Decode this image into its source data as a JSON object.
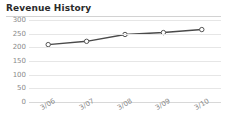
{
  "header": {
    "title": "Revenue History"
  },
  "chart_data": {
    "type": "line",
    "title": "Revenue History",
    "xlabel": "",
    "ylabel": "",
    "categories": [
      "3/06",
      "3/07",
      "3/08",
      "3/09",
      "3/10"
    ],
    "series": [
      {
        "name": "Revenue",
        "values": [
          210,
          222,
          247,
          254,
          265
        ]
      }
    ],
    "ylim": [
      0,
      300
    ],
    "yticks": [
      300,
      250,
      200,
      150,
      100,
      50,
      0
    ],
    "ytick_labels": [
      "300",
      "250",
      "200",
      "150",
      "100",
      "50",
      "0"
    ],
    "grid": true,
    "legend": "none",
    "marker": "open-circle",
    "colors": {
      "line": "#4a4a4a",
      "marker_fill": "#ffffff",
      "marker_stroke": "#555555",
      "grid": "#e6e6e6",
      "axis_text": "#8a8a8a",
      "title_text": "#2b2b2b",
      "rule": "#d2d2d2",
      "background": "#ffffff"
    }
  }
}
